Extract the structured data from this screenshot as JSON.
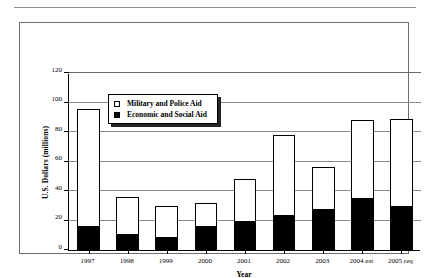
{
  "figure": {
    "y_axis_title": "U.S. Dollars (millions)",
    "x_axis_title": "Year"
  },
  "legend": {
    "items": [
      {
        "label": "Military and Police Aid",
        "swatch": "hollow-square-icon",
        "color": "#ffffff"
      },
      {
        "label": "Economic and Social Aid",
        "swatch": "filled-square-icon",
        "color": "#000000"
      }
    ]
  },
  "chart_data": {
    "type": "bar",
    "stacked": true,
    "title": "",
    "xlabel": "Year",
    "ylabel": "U.S. Dollars (millions)",
    "ylim": [
      0,
      120
    ],
    "yticks": [
      0,
      20,
      40,
      60,
      80,
      100,
      120
    ],
    "ytick_labels": [
      "0",
      "20",
      "40",
      "60",
      "80",
      "100",
      "120"
    ],
    "grid": true,
    "legend_position": "upper-left-inside",
    "categories": [
      "1997",
      "1998",
      "1999",
      "2000",
      "2001",
      "2002",
      "2003",
      "2004 est",
      "2005 req"
    ],
    "series": [
      {
        "name": "Economic and Social Aid",
        "color": "#000000",
        "values": [
          16,
          11,
          9,
          16,
          20,
          24,
          28,
          35,
          30
        ]
      },
      {
        "name": "Military and Police Aid",
        "color": "#ffffff",
        "values": [
          79.5,
          25,
          21,
          16,
          28,
          54,
          28,
          53,
          59
        ]
      }
    ],
    "totals": [
      95.5,
      36,
      30,
      32,
      48,
      78,
      56,
      88,
      89
    ]
  }
}
